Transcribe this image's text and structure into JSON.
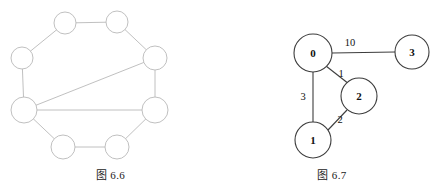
{
  "page": {
    "background_color": "#ffffff",
    "width": 443,
    "height": 193
  },
  "figures": [
    {
      "id": "figure-left",
      "caption": "图 6.6",
      "type": "graph-diagram",
      "description": "unweighted-octagon-graph",
      "style": {
        "edge_color": "#b9b9b9",
        "node_fill": "#ffffff",
        "node_stroke": "#b9b9b9"
      },
      "nodes": [
        {
          "id": "n0",
          "label": "",
          "cx": 65,
          "cy": 23,
          "r": 11
        },
        {
          "id": "n1",
          "label": "",
          "cx": 117,
          "cy": 22,
          "r": 11
        },
        {
          "id": "n2",
          "label": "",
          "cx": 155,
          "cy": 58,
          "r": 12
        },
        {
          "id": "n3",
          "label": "",
          "cx": 155,
          "cy": 110,
          "r": 13
        },
        {
          "id": "n4",
          "label": "",
          "cx": 117,
          "cy": 147,
          "r": 12
        },
        {
          "id": "n5",
          "label": "",
          "cx": 63,
          "cy": 147,
          "r": 12
        },
        {
          "id": "n6",
          "label": "",
          "cx": 24,
          "cy": 110,
          "r": 13
        },
        {
          "id": "n7",
          "label": "",
          "cx": 22,
          "cy": 58,
          "r": 11
        }
      ],
      "edges": [
        {
          "from": "n0",
          "to": "n1",
          "weight": null
        },
        {
          "from": "n1",
          "to": "n2",
          "weight": null
        },
        {
          "from": "n2",
          "to": "n3",
          "weight": null
        },
        {
          "from": "n3",
          "to": "n4",
          "weight": null
        },
        {
          "from": "n4",
          "to": "n5",
          "weight": null
        },
        {
          "from": "n5",
          "to": "n6",
          "weight": null
        },
        {
          "from": "n6",
          "to": "n7",
          "weight": null
        },
        {
          "from": "n7",
          "to": "n0",
          "weight": null
        },
        {
          "from": "n6",
          "to": "n2",
          "weight": null
        },
        {
          "from": "n6",
          "to": "n3",
          "weight": null
        }
      ]
    },
    {
      "id": "figure-right",
      "caption": "图 6.7",
      "type": "weighted-graph-diagram",
      "description": "weighted-graph-four-nodes",
      "style": {
        "edge_color": "#3d3d3d",
        "node_fill": "#ffffff",
        "node_stroke": "#3d3d3d"
      },
      "nodes": [
        {
          "id": "v0",
          "label": "0",
          "cx": 92,
          "cy": 53,
          "r": 19
        },
        {
          "id": "v3",
          "label": "3",
          "cx": 191,
          "cy": 52,
          "r": 17
        },
        {
          "id": "v2",
          "label": "2",
          "cx": 138,
          "cy": 96,
          "r": 18
        },
        {
          "id": "v1",
          "label": "1",
          "cx": 92,
          "cy": 140,
          "r": 18
        }
      ],
      "edges": [
        {
          "from": "v0",
          "to": "v3",
          "weight": "10",
          "label_x": 129,
          "label_y": 42
        },
        {
          "from": "v0",
          "to": "v2",
          "weight": "1",
          "label_x": 120,
          "label_y": 73
        },
        {
          "from": "v0",
          "to": "v1",
          "weight": "3",
          "label_x": 82,
          "label_y": 96
        },
        {
          "from": "v1",
          "to": "v2",
          "weight": "2",
          "label_x": 119,
          "label_y": 119
        }
      ]
    }
  ]
}
